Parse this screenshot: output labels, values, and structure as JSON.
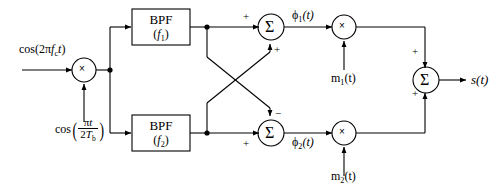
{
  "diagram": {
    "background_color": "#ffffff",
    "line_color": "#000000",
    "width": 499,
    "height": 187
  },
  "inputs": {
    "carrier_label_prefix": "cos(2",
    "carrier_label_pi": "π",
    "carrier_label_f": "f",
    "carrier_label_fsub": "c",
    "carrier_label_t": "t",
    "carrier_label_suffix": ")",
    "carrier_full": "cos(2πf_c t)",
    "clock_label_cos": "cos",
    "clock_num_pi": "π",
    "clock_num_t": "t",
    "clock_den_2": "2",
    "clock_den_T": "T",
    "clock_den_Tsub": "b",
    "clock_full": "cos(πt / 2T_b)"
  },
  "blocks": {
    "mixer_input": {
      "symbol": "×",
      "name": "input-multiplier"
    },
    "bpf1": {
      "line1": "BPF",
      "line2_open": "(",
      "line2_f": "f",
      "line2_sub": "1",
      "line2_close": ")",
      "full": "BPF (f1)"
    },
    "bpf2": {
      "line1": "BPF",
      "line2_open": "(",
      "line2_f": "f",
      "line2_sub": "2",
      "line2_close": ")",
      "full": "BPF (f2)"
    },
    "sum_top": {
      "symbol": "Σ",
      "sign_left": "+",
      "sign_bottom": "+"
    },
    "sum_bottom": {
      "symbol": "Σ",
      "sign_left": "+",
      "sign_top": "−"
    },
    "mult_top": {
      "symbol": "×"
    },
    "mult_bottom": {
      "symbol": "×"
    },
    "sum_out": {
      "symbol": "Σ",
      "sign_top": "+",
      "sign_bottom": "+"
    }
  },
  "signals": {
    "phi1_sym": "ϕ",
    "phi1_sub": "1",
    "phi1_arg": "(t)",
    "phi1_full": "ϕ1(t)",
    "phi2_sym": "ϕ",
    "phi2_sub": "2",
    "phi2_arg": "(t)",
    "phi2_full": "ϕ2(t)",
    "m1_sym": "m",
    "m1_sub": "1",
    "m1_arg": "(t)",
    "m1_full": "m1(t)",
    "m2_sym": "m",
    "m2_sub": "2",
    "m2_arg": "(t)",
    "m2_full": "m2(t)",
    "output_sym": "s",
    "output_arg": "(t)",
    "output_full": "s(t)"
  }
}
